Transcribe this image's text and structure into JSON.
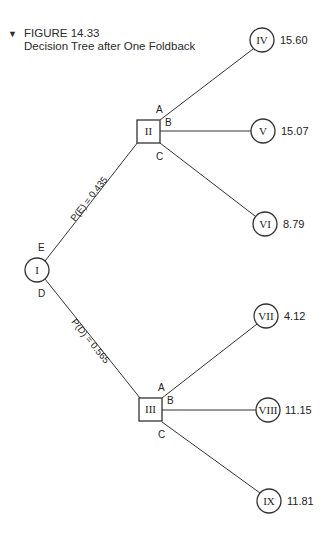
{
  "figure": {
    "marker": "▼",
    "number": "FIGURE 14.33",
    "title": "Decision Tree after One Foldback"
  },
  "nodes": {
    "I": {
      "label": "I",
      "type": "chance",
      "cx": 37,
      "cy": 270
    },
    "II": {
      "label": "II",
      "type": "decision",
      "x": 137,
      "y": 120,
      "size": 23
    },
    "III": {
      "label": "III",
      "type": "decision",
      "x": 139,
      "y": 398,
      "size": 23
    },
    "IV": {
      "label": "IV",
      "type": "terminal",
      "cx": 262,
      "cy": 40,
      "value": "15.60"
    },
    "V": {
      "label": "V",
      "type": "terminal",
      "cx": 263,
      "cy": 131,
      "value": "15.07"
    },
    "VI": {
      "label": "VI",
      "type": "terminal",
      "cx": 265,
      "cy": 224,
      "value": "8.79"
    },
    "VII": {
      "label": "VII",
      "type": "terminal",
      "cx": 266,
      "cy": 316,
      "value": "4.12"
    },
    "VIII": {
      "label": "VIII",
      "type": "terminal",
      "cx": 268,
      "cy": 410,
      "value": "11.15"
    },
    "IX": {
      "label": "IX",
      "type": "terminal",
      "cx": 269,
      "cy": 501,
      "value": "11.81"
    }
  },
  "branches": {
    "E": "E",
    "D": "D",
    "A_top": "A",
    "B_top": "B",
    "C_top": "C",
    "A_bottom": "A",
    "B_bottom": "B",
    "C_bottom": "C"
  },
  "probabilities": {
    "E": "P(E) = 0.435",
    "D": "P(D) = 0.565"
  }
}
